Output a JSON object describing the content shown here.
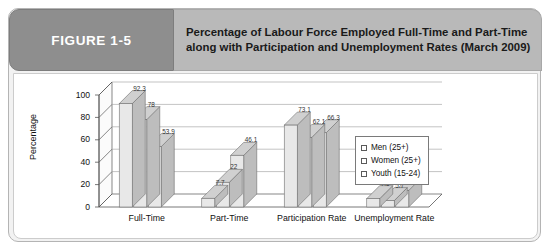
{
  "figure": {
    "badge_label": "FIGURE 1-5",
    "title": "Percentage of Labour Force Employed Full-Time and Part-Time along with Participation and Unemployment Rates (March 2009)"
  },
  "legend": {
    "items": [
      {
        "label": "Men (25+)"
      },
      {
        "label": "Women (25+)"
      },
      {
        "label": "Youth (15-24)"
      }
    ]
  },
  "colors": {
    "badge_background": "#8e8e8e",
    "title_background": "#b9b9b9",
    "card_background": "#f2f2f2",
    "panel_background": "#ffffff",
    "bar_face": "#e8e8e8",
    "bar_top": "#d0d0d0",
    "bar_side": "#bdbdbd",
    "axis_line": "#555555",
    "gridline": "#aaaaaa"
  },
  "chart_data": {
    "type": "bar",
    "title": "Percentage of Labour Force Employed Full-Time and Part-Time along with Participation and Unemployment Rates (March 2009)",
    "xlabel": "",
    "ylabel": "Percentage",
    "ylim": [
      0,
      100
    ],
    "yticks": [
      0,
      20,
      40,
      60,
      80,
      100
    ],
    "ytick_labels": [
      "0",
      "20",
      "40",
      "60",
      "80",
      "100"
    ],
    "grid": true,
    "legend_position": "right",
    "three_d": true,
    "categories": [
      "Full-Time",
      "Part-Time",
      "Participation Rate",
      "Unemployment Rate"
    ],
    "series": [
      {
        "name": "Men (25+)",
        "values": [
          92.3,
          7.7,
          73.1,
          7.5
        ]
      },
      {
        "name": "Women (25+)",
        "values": [
          78,
          22,
          62.1,
          5.7
        ]
      },
      {
        "name": "Youth (15-24)",
        "values": [
          53.9,
          46.1,
          66.3,
          14.8
        ]
      }
    ],
    "value_labels": [
      [
        "92.3",
        "7.7",
        "73.1",
        "7.5"
      ],
      [
        "78",
        "22",
        "62.1",
        "5.7"
      ],
      [
        "53.9",
        "46.1",
        "66.3",
        "14.8"
      ]
    ]
  }
}
